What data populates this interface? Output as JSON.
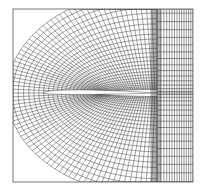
{
  "figure": {
    "title": "C-grid computational mesh around an airfoil",
    "type": "structured-mesh",
    "frame": {
      "x0": 13,
      "y0": 9,
      "x1": 193,
      "y1": 182
    },
    "airfoil": {
      "leading_edge_x": 43,
      "trailing_edge_x": 157,
      "chord_y": 93,
      "max_half_thickness": 3.2
    },
    "wake_cut_x": 157,
    "wake_grid": {
      "x_start": 157,
      "x_end": 193,
      "columns": 14,
      "rows": 30
    },
    "c_region": {
      "radial_lines": 26,
      "circumferential_lines": 80
    },
    "colors": {
      "line": "#333333",
      "dense": "#222222",
      "background": "#ffffff",
      "airfoil_fill": "#ffffff",
      "frame": "#555555"
    }
  }
}
